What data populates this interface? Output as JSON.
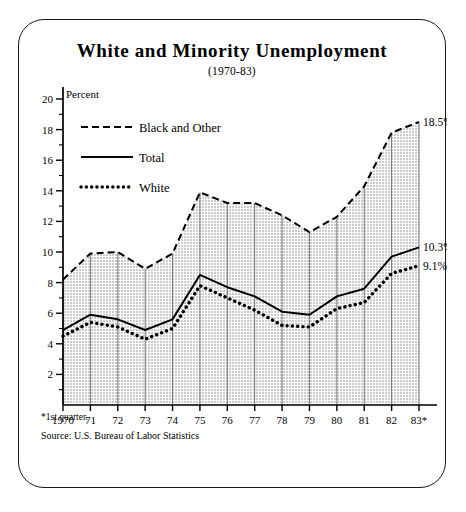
{
  "figure": {
    "title": "White and Minority Unemployment",
    "subtitle": "(1970-83)",
    "axis_note": "Percent",
    "footnote": "*1st quarter.",
    "source": "Source: U.S. Bureau of Labor Statistics"
  },
  "legend": [
    {
      "key": "black_and_other",
      "label": "Black and Other",
      "style": "dashed"
    },
    {
      "key": "total",
      "label": "Total",
      "style": "solid"
    },
    {
      "key": "white",
      "label": "White",
      "style": "dotted"
    }
  ],
  "end_labels": [
    {
      "series": "black_and_other",
      "text": "18.5%",
      "value": 18.5
    },
    {
      "series": "total",
      "text": "10.3%",
      "value": 10.3
    },
    {
      "series": "white",
      "text": "9.1%",
      "value": 9.1
    }
  ],
  "colors": {
    "ink": "#000000",
    "frame": "#1a1a1a",
    "fill": "#e8e8e8",
    "gridline": "#555555"
  },
  "chart_data": {
    "type": "line",
    "title": "White and Minority Unemployment",
    "subtitle": "(1970-83)",
    "xlabel": "",
    "ylabel": "Percent",
    "ylim": [
      0,
      20
    ],
    "yticks": [
      2,
      4,
      6,
      8,
      10,
      12,
      14,
      16,
      18,
      20
    ],
    "yminorticks": [
      1,
      3,
      5,
      7,
      9,
      11,
      13,
      15,
      17,
      19
    ],
    "grid": "vertical-droplines",
    "legend_position": "upper-left-inside",
    "x": [
      1970,
      1971,
      1972,
      1973,
      1974,
      1975,
      1976,
      1977,
      1978,
      1979,
      1980,
      1981,
      1982,
      1983
    ],
    "categories": [
      "1970",
      "71",
      "72",
      "73",
      "74",
      "75",
      "76",
      "77",
      "78",
      "79",
      "80",
      "81",
      "82",
      "83*"
    ],
    "series": [
      {
        "name": "Black and Other",
        "style": "dashed",
        "values": [
          8.2,
          9.9,
          10.0,
          8.9,
          9.9,
          13.9,
          13.2,
          13.2,
          12.4,
          11.3,
          12.3,
          14.3,
          17.8,
          18.5
        ]
      },
      {
        "name": "Total",
        "style": "solid",
        "values": [
          4.9,
          5.9,
          5.6,
          4.9,
          5.6,
          8.5,
          7.7,
          7.1,
          6.1,
          5.9,
          7.1,
          7.6,
          9.7,
          10.3
        ]
      },
      {
        "name": "White",
        "style": "dotted",
        "values": [
          4.5,
          5.4,
          5.1,
          4.3,
          5.0,
          7.8,
          7.0,
          6.2,
          5.2,
          5.1,
          6.3,
          6.7,
          8.6,
          9.1
        ]
      }
    ]
  }
}
